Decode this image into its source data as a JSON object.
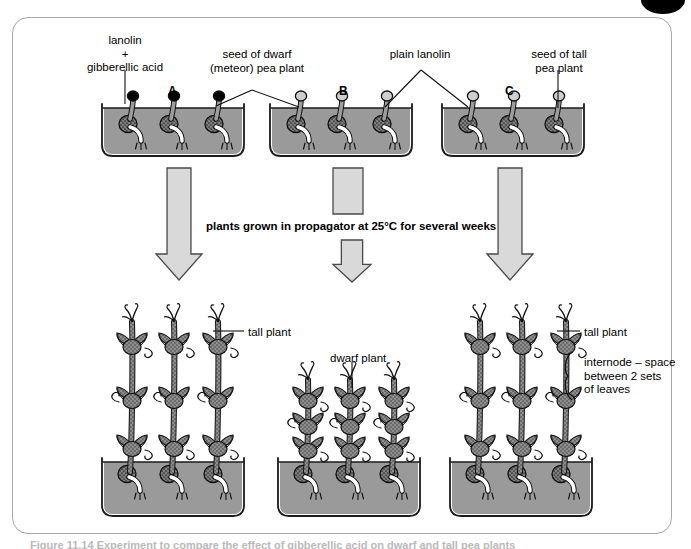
{
  "figure": {
    "caption_partial": "Figure 11.14 Experiment to compare the effect of gibberellic acid on dwarf and tall pea plants"
  },
  "colors": {
    "border": "#a8a8a8",
    "soil": "#9a9a9a",
    "tray_outline": "#1a1a1a",
    "plant_fill": "#8d8d8d",
    "arrow_fill": "#d9d9d9",
    "arrow_outline": "#4a4a4a",
    "lanolin_gibberellic": "#000000",
    "lanolin_plain": "#cfcfcf",
    "seed_fill": "#8d8d8d",
    "radicle": "#ffffff",
    "text": "#000000"
  },
  "top_labels": [
    {
      "id": "lanolin-gibberellic-acid",
      "lines": "lanolin\n+\ngibberellic acid",
      "x": 64,
      "y": 34,
      "w": 122,
      "align": "center"
    },
    {
      "id": "seed-of-dwarf-pea-plant",
      "lines": "seed of dwarf\n(meteor) pea plant",
      "x": 196,
      "y": 48,
      "w": 122,
      "align": "center"
    },
    {
      "id": "plain-lanolin",
      "lines": "plain lanolin",
      "x": 375,
      "y": 48,
      "w": 90,
      "align": "center"
    },
    {
      "id": "seed-of-tall-pea-plant",
      "lines": "seed of tall\npea plant",
      "x": 513,
      "y": 48,
      "w": 92,
      "align": "center"
    }
  ],
  "tray_letters": [
    {
      "label": "A",
      "x": 168,
      "y": 84
    },
    {
      "label": "B",
      "x": 339,
      "y": 84
    },
    {
      "label": "C",
      "x": 505,
      "y": 84
    }
  ],
  "process_text": {
    "label": "plants grown in propagator at 25°C for several weeks",
    "x": 206,
    "y": 220
  },
  "bottom_labels": [
    {
      "id": "tall-plant-left",
      "lines": "tall plant",
      "x": 248,
      "y": 326,
      "w": 70,
      "align": "left"
    },
    {
      "id": "dwarf-plant",
      "lines": "dwarf plant",
      "x": 330,
      "y": 352,
      "w": 74,
      "align": "left"
    },
    {
      "id": "tall-plant-right",
      "lines": "tall plant",
      "x": 584,
      "y": 326,
      "w": 70,
      "align": "left"
    },
    {
      "id": "internode-definition",
      "lines": "internode – space\nbetween 2 sets\nof leaves",
      "x": 584,
      "y": 356,
      "w": 100,
      "align": "left"
    }
  ],
  "top_trays": [
    {
      "id": "tray-A",
      "x": 104,
      "y": 108,
      "w": 138,
      "h": 46,
      "treatment": "lanolin + gibberellic acid",
      "seed_type": "dwarf (meteor) pea",
      "cap_color": "#000000",
      "seed_x": [
        24,
        65,
        110
      ]
    },
    {
      "id": "tray-B",
      "x": 272,
      "y": 108,
      "w": 138,
      "h": 46,
      "treatment": "plain lanolin",
      "seed_type": "dwarf (meteor) pea",
      "cap_color": "#cfcfcf",
      "seed_x": [
        24,
        65,
        110
      ]
    },
    {
      "id": "tray-C",
      "x": 444,
      "y": 108,
      "w": 138,
      "h": 46,
      "treatment": "plain lanolin",
      "seed_type": "tall pea",
      "cap_color": "#cfcfcf",
      "seed_x": [
        24,
        65,
        110
      ]
    }
  ],
  "bottom_trays": [
    {
      "id": "result-tray-A",
      "x": 104,
      "y": 462,
      "w": 138,
      "h": 52,
      "result": "tall plant",
      "plant_type": "tall",
      "plant_x": [
        26,
        68,
        112
      ],
      "stem_top": 310
    },
    {
      "id": "result-tray-B",
      "x": 280,
      "y": 462,
      "w": 138,
      "h": 52,
      "result": "dwarf plant",
      "plant_type": "dwarf",
      "plant_x": [
        26,
        68,
        112
      ],
      "stem_top": 378
    },
    {
      "id": "result-tray-C",
      "x": 452,
      "y": 462,
      "w": 138,
      "h": 52,
      "result": "tall plant",
      "plant_type": "tall",
      "plant_x": [
        26,
        68,
        112
      ],
      "stem_top": 310
    }
  ],
  "arrows": [
    {
      "id": "arrow-left",
      "x": 156,
      "y": 168,
      "w": 46,
      "len": 112,
      "split": false
    },
    {
      "id": "arrow-middle-upper",
      "x": 333,
      "y": 168,
      "w": 30,
      "len": 46,
      "split": true
    },
    {
      "id": "arrow-middle-lower",
      "x": 333,
      "y": 240,
      "w": 38,
      "len": 42,
      "split": true
    },
    {
      "id": "arrow-right",
      "x": 487,
      "y": 168,
      "w": 46,
      "len": 112,
      "split": false
    }
  ],
  "leader_lines": [
    {
      "id": "leader-lanolin-gibberellic",
      "from": [
        125,
        70
      ],
      "to": [
        125,
        104
      ]
    },
    {
      "id": "leader-dwarf-seed-left",
      "from": [
        252,
        90
      ],
      "to": [
        216,
        106
      ]
    },
    {
      "id": "leader-dwarf-seed-right",
      "from": [
        252,
        90
      ],
      "to": [
        299,
        107
      ]
    },
    {
      "id": "leader-plain-lanolin-left",
      "from": [
        421,
        70
      ],
      "to": [
        385,
        107
      ]
    },
    {
      "id": "leader-plain-lanolin-right",
      "from": [
        421,
        70
      ],
      "to": [
        468,
        107
      ]
    },
    {
      "id": "leader-tall-seed",
      "from": [
        558,
        70
      ],
      "to": [
        558,
        108
      ]
    },
    {
      "id": "leader-tall-plant-left",
      "from": [
        244,
        331
      ],
      "to": [
        213,
        331
      ]
    },
    {
      "id": "leader-dwarf-plant",
      "from": [
        352,
        362
      ],
      "to": [
        352,
        388
      ]
    },
    {
      "id": "leader-tall-plant-right",
      "from": [
        580,
        331
      ],
      "to": [
        557,
        331
      ]
    }
  ]
}
